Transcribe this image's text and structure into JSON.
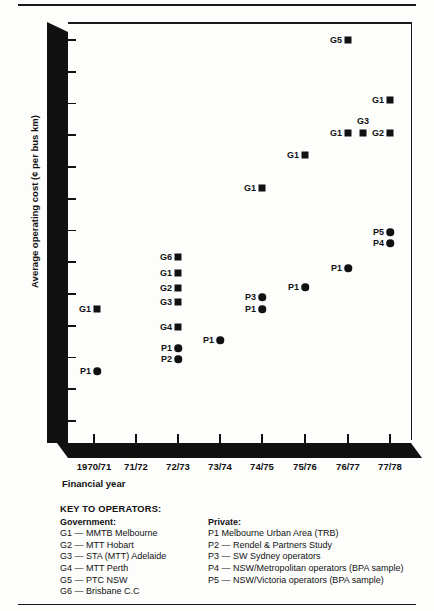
{
  "chart_data": {
    "type": "scatter",
    "title": "",
    "xlabel": "Financial year",
    "ylabel": "Average operating cost (¢ per bus km)",
    "categories": [
      "1970/71",
      "71/72",
      "72/73",
      "73/74",
      "74/75",
      "75/76",
      "76/77",
      "77/78"
    ],
    "ylim": [
      0,
      135
    ],
    "yticks": [
      10,
      20,
      30,
      40,
      50,
      60,
      70,
      80,
      90,
      100,
      110,
      120,
      130
    ],
    "grid": false,
    "legend_position": "below-plot",
    "series": [
      {
        "name": "Government",
        "marker": "square",
        "points": [
          {
            "label": "G1",
            "x": "1970/71",
            "y": 45
          },
          {
            "label": "G6",
            "x": "72/73",
            "y": 61
          },
          {
            "label": "G1",
            "x": "72/73",
            "y": 56
          },
          {
            "label": "G2",
            "x": "72/73",
            "y": 52
          },
          {
            "label": "G3",
            "x": "72/73",
            "y": 48
          },
          {
            "label": "G4",
            "x": "72/73",
            "y": 39
          },
          {
            "label": "G1",
            "x": "74/75",
            "y": 83
          },
          {
            "label": "G1",
            "x": "75/76",
            "y": 93
          },
          {
            "label": "G5",
            "x": "76/77",
            "y": 130
          },
          {
            "label": "G1",
            "x": "76/77",
            "y": 100
          },
          {
            "label": "G3",
            "x": "76/77 - 77/78",
            "y": 100
          },
          {
            "label": "G1",
            "x": "77/78",
            "y": 110
          },
          {
            "label": "G2",
            "x": "77/78",
            "y": 100
          }
        ]
      },
      {
        "name": "Private",
        "marker": "circle",
        "points": [
          {
            "label": "P1",
            "x": "1970/71",
            "y": 25
          },
          {
            "label": "P1",
            "x": "72/73",
            "y": 33
          },
          {
            "label": "P2",
            "x": "72/73",
            "y": 30
          },
          {
            "label": "P1",
            "x": "73/74",
            "y": 35
          },
          {
            "label": "P3",
            "x": "74/75",
            "y": 49
          },
          {
            "label": "P1",
            "x": "74/75",
            "y": 45
          },
          {
            "label": "P1",
            "x": "75/76",
            "y": 52
          },
          {
            "label": "P1",
            "x": "76/77",
            "y": 58
          },
          {
            "label": "P5",
            "x": "77/78",
            "y": 70
          },
          {
            "label": "P4",
            "x": "77/78",
            "y": 67
          }
        ]
      }
    ],
    "plot_points": [
      {
        "label": "G5",
        "px": 348,
        "py": 40,
        "marker": "square",
        "tag": "left"
      },
      {
        "label": "G1",
        "px": 390,
        "py": 100,
        "marker": "square",
        "tag": "left"
      },
      {
        "label": "G3",
        "px": 363,
        "py": 133,
        "marker": "square",
        "tag": "above"
      },
      {
        "label": "G1",
        "px": 348,
        "py": 133,
        "marker": "square",
        "tag": "left"
      },
      {
        "label": "G2",
        "px": 390,
        "py": 133,
        "marker": "square",
        "tag": "left"
      },
      {
        "label": "G1",
        "px": 305,
        "py": 155,
        "marker": "square",
        "tag": "left"
      },
      {
        "label": "G1",
        "px": 262,
        "py": 188,
        "marker": "square",
        "tag": "left"
      },
      {
        "label": "P5",
        "px": 390,
        "py": 232,
        "marker": "circle",
        "tag": "left"
      },
      {
        "label": "P4",
        "px": 390,
        "py": 243,
        "marker": "circle",
        "tag": "left"
      },
      {
        "label": "G6",
        "px": 178,
        "py": 257,
        "marker": "square",
        "tag": "left"
      },
      {
        "label": "P1",
        "px": 348,
        "py": 268,
        "marker": "circle",
        "tag": "left"
      },
      {
        "label": "G1",
        "px": 178,
        "py": 273,
        "marker": "square",
        "tag": "left"
      },
      {
        "label": "P1",
        "px": 305,
        "py": 287,
        "marker": "circle",
        "tag": "left"
      },
      {
        "label": "G2",
        "px": 178,
        "py": 288,
        "marker": "square",
        "tag": "left"
      },
      {
        "label": "P3",
        "px": 262,
        "py": 297,
        "marker": "circle",
        "tag": "left"
      },
      {
        "label": "G3",
        "px": 178,
        "py": 302,
        "marker": "square",
        "tag": "left"
      },
      {
        "label": "P1",
        "px": 262,
        "py": 309,
        "marker": "circle",
        "tag": "left"
      },
      {
        "label": "G1",
        "px": 97,
        "py": 309,
        "marker": "square",
        "tag": "left"
      },
      {
        "label": "G4",
        "px": 178,
        "py": 327,
        "marker": "square",
        "tag": "left"
      },
      {
        "label": "P1",
        "px": 220,
        "py": 340,
        "marker": "circle",
        "tag": "left"
      },
      {
        "label": "P1",
        "px": 178,
        "py": 348,
        "marker": "circle",
        "tag": "left"
      },
      {
        "label": "P2",
        "px": 178,
        "py": 359,
        "marker": "circle",
        "tag": "left"
      },
      {
        "label": "P1",
        "px": 97,
        "py": 371,
        "marker": "circle",
        "tag": "left"
      }
    ],
    "xtick_px": [
      94,
      136,
      178,
      220,
      262,
      305,
      348,
      390
    ]
  },
  "legend": {
    "title": "KEY TO OPERATORS:",
    "government_heading": "Government:",
    "private_heading": "Private:",
    "government": [
      "G1 — MMTB Melbourne",
      "G2 — MTT Hobart",
      "G3 — STA (MTT) Adelaide",
      "G4 — MTT Perth",
      "G5 — PTC NSW",
      "G6 — Brisbane C.C"
    ],
    "private": [
      "P1    Melbourne Urban Area (TRB)",
      "P2 — Rendel & Partners Study",
      "P3 — SW Sydney operators",
      "P4 — NSW/Metropolitan operators (BPA sample)",
      "P5 — NSW/Victoria operators (BPA sample)"
    ]
  },
  "colors": {
    "ink": "#111111",
    "paper": "#fdfdfc"
  }
}
